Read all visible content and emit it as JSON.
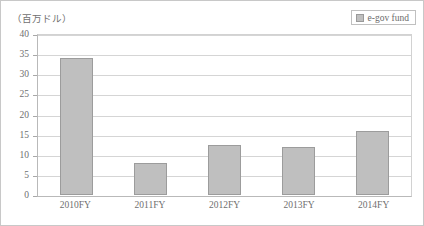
{
  "chart_data": {
    "type": "bar",
    "title": "",
    "subtitle": "",
    "unit_label": "（百万ドル）",
    "xlabel": "",
    "ylabel": "",
    "categories": [
      "2010FY",
      "2011FY",
      "2012FY",
      "2013FY",
      "2014FY"
    ],
    "series": [
      {
        "name": "e-gov fund",
        "values": [
          34,
          8,
          12.5,
          12,
          16
        ],
        "color": "#bfbfbf"
      }
    ],
    "ylim": [
      0,
      40
    ],
    "ytick_step": 5,
    "ytick_labels": [
      "40",
      "35",
      "30",
      "25",
      "20",
      "15",
      "10",
      "5",
      "0"
    ],
    "grid": true,
    "grid_axis": "y",
    "legend": {
      "position": "top-right",
      "entries": [
        {
          "label": "e-gov fund",
          "color": "#bfbfbf"
        }
      ]
    },
    "annotations": []
  },
  "figure": {
    "unit_label": "（百万ドル）",
    "frame_color": "#c8c8c8",
    "grid_color": "#d5d5d5",
    "axis_color": "#b9b9b9",
    "text_color": "#6f6f6f"
  },
  "legend": {
    "entry_label": "e-gov fund"
  }
}
